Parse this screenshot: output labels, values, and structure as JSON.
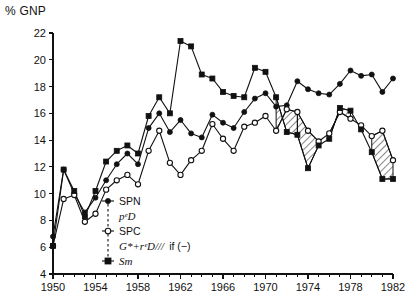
{
  "figure": {
    "y_axis_title": "% GNP",
    "background_color": "#ffffff",
    "ink_color": "#111111"
  },
  "legend": {
    "position": "inside-lower-left",
    "items": [
      {
        "key": "SPN",
        "label": "SPN",
        "marker": "filled-circle"
      },
      {
        "key": "peD",
        "label": "pᵉD",
        "marker": "none"
      },
      {
        "key": "SPC",
        "label": "SPC",
        "marker": "open-circle"
      },
      {
        "key": "hatch",
        "label": "G*+rᵉD///",
        "suffix": "if (−)",
        "marker": "none"
      },
      {
        "key": "ST",
        "label": "Sт",
        "marker": "filled-square"
      }
    ]
  },
  "chart_data": {
    "type": "line",
    "title": "",
    "subtitle": "",
    "xlabel": "",
    "ylabel": "% GNP",
    "xlim": [
      1950,
      1982
    ],
    "ylim": [
      4,
      22
    ],
    "ytick_step": 2,
    "xtick_step_major": 4,
    "xtick_step_minor": 1,
    "grid": false,
    "yticks": [
      4,
      6,
      8,
      10,
      12,
      14,
      16,
      18,
      20,
      22
    ],
    "xticks": [
      1950,
      1954,
      1958,
      1962,
      1966,
      1970,
      1974,
      1978,
      1982
    ],
    "x": [
      1950,
      1951,
      1952,
      1953,
      1954,
      1955,
      1956,
      1957,
      1958,
      1959,
      1960,
      1961,
      1962,
      1963,
      1964,
      1965,
      1966,
      1967,
      1968,
      1969,
      1970,
      1971,
      1972,
      1973,
      1974,
      1975,
      1976,
      1977,
      1978,
      1979,
      1980,
      1981,
      1982
    ],
    "series": [
      {
        "name": "SPN",
        "key": "SPN",
        "marker": "filled-circle",
        "values": [
          6.8,
          11.8,
          10.0,
          8.6,
          9.7,
          11.0,
          12.2,
          13.0,
          12.2,
          14.9,
          16.0,
          14.6,
          15.5,
          14.5,
          14.2,
          15.9,
          15.3,
          14.9,
          16.1,
          17.1,
          17.5,
          16.5,
          16.6,
          18.4,
          17.8,
          17.5,
          17.4,
          18.2,
          19.2,
          18.8,
          18.9,
          17.6,
          18.6
        ]
      },
      {
        "name": "SPC",
        "key": "SPC",
        "marker": "open-circle",
        "values": [
          6.1,
          9.6,
          9.9,
          7.9,
          8.5,
          10.3,
          11.0,
          11.4,
          10.7,
          13.2,
          14.7,
          12.3,
          11.4,
          12.5,
          13.2,
          15.2,
          14.1,
          13.2,
          15.0,
          15.3,
          15.8,
          14.7,
          16.3,
          16.1,
          14.7,
          13.9,
          14.5,
          16.1,
          15.6,
          15.1,
          14.3,
          14.7,
          12.5
        ]
      },
      {
        "name": "S_T",
        "key": "ST",
        "marker": "filled-square",
        "values": [
          6.1,
          11.8,
          10.2,
          8.3,
          10.2,
          12.4,
          13.2,
          13.6,
          13.0,
          15.8,
          17.2,
          16.0,
          21.4,
          21.0,
          18.9,
          18.6,
          17.6,
          17.3,
          17.2,
          19.4,
          19.1,
          17.2,
          14.6,
          14.4,
          11.9,
          13.6,
          14.1,
          16.4,
          16.2,
          14.8,
          13.1,
          11.1,
          11.1
        ]
      }
    ],
    "hatched_regions": [
      {
        "label": "G*+rᵉD if (−)",
        "x_start": 1971,
        "x_end": 1973,
        "between": [
          "SPC",
          "ST"
        ]
      },
      {
        "label": "G*+rᵉD if (−)",
        "x_start": 1973,
        "x_end": 1975,
        "between": [
          "SPC",
          "ST"
        ]
      },
      {
        "label": "G*+rᵉD if (−)",
        "x_start": 1976,
        "x_end": 1978,
        "between": [
          "SPC",
          "ST"
        ]
      },
      {
        "label": "G*+rᵉD if (−)",
        "x_start": 1980,
        "x_end": 1982,
        "between": [
          "SPC",
          "ST"
        ]
      }
    ]
  }
}
